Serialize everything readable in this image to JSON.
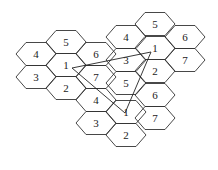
{
  "diagram": {
    "title": "",
    "hex": {
      "half_width": 20,
      "top_half_width": 10,
      "half_height": 11.5
    },
    "cells": [
      {
        "x": 155,
        "y": 24,
        "label": "5"
      },
      {
        "x": 126,
        "y": 37,
        "label": "4"
      },
      {
        "x": 185,
        "y": 37,
        "label": "6"
      },
      {
        "x": 66,
        "y": 42,
        "label": "5"
      },
      {
        "x": 36,
        "y": 54,
        "label": "4"
      },
      {
        "x": 96,
        "y": 54,
        "label": "6"
      },
      {
        "x": 155,
        "y": 48,
        "label": "1"
      },
      {
        "x": 126,
        "y": 60,
        "label": "3"
      },
      {
        "x": 185,
        "y": 60,
        "label": "7"
      },
      {
        "x": 66,
        "y": 65,
        "label": "1"
      },
      {
        "x": 36,
        "y": 77,
        "label": "3"
      },
      {
        "x": 96,
        "y": 77,
        "label": "7"
      },
      {
        "x": 155,
        "y": 71,
        "label": "2"
      },
      {
        "x": 66,
        "y": 88,
        "label": "2"
      },
      {
        "x": 126,
        "y": 83,
        "label": "5"
      },
      {
        "x": 96,
        "y": 100,
        "label": "4"
      },
      {
        "x": 155,
        "y": 95,
        "label": "6"
      },
      {
        "x": 126,
        "y": 112,
        "label": "1"
      },
      {
        "x": 96,
        "y": 123,
        "label": "3"
      },
      {
        "x": 155,
        "y": 118,
        "label": "7"
      },
      {
        "x": 126,
        "y": 135,
        "label": "2"
      }
    ],
    "links": [
      {
        "from": [
          72,
          68
        ],
        "to": [
          151,
          52
        ]
      },
      {
        "from": [
          151,
          52
        ],
        "to": [
          125,
          113
        ]
      },
      {
        "from": [
          72,
          68
        ],
        "to": [
          125,
          113
        ]
      }
    ]
  }
}
